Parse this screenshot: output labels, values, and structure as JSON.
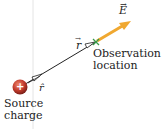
{
  "diagram": {
    "source_label_line1": "Source",
    "source_label_line2": "charge",
    "observation_label_line1": "Observation",
    "observation_label_line2": "location",
    "field_label": "E",
    "r_vector_label": "r",
    "r_hat_label": "r̂",
    "charge_sign": "+",
    "colors": {
      "charge": "#b8342a",
      "field_arrow": "#f0a830",
      "marker": "#3a9a4a",
      "line": "#222222"
    }
  }
}
